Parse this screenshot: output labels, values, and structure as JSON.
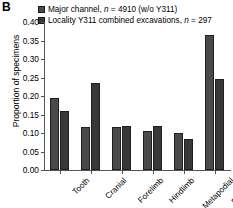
{
  "panel": {
    "label": "B"
  },
  "legend": {
    "items": [
      {
        "icon": "legend-swatch-square",
        "label_pre": "Major channel, ",
        "label_ital": "n",
        "label_post": " = 4910 (w/o Y311)",
        "color": "#4a4a4a"
      },
      {
        "icon": "legend-swatch-square",
        "label_pre": "Locality Y311 combined excavations, ",
        "label_ital": "n",
        "label_post": " = 297",
        "color": "#383838"
      }
    ]
  },
  "chart_data": {
    "type": "bar",
    "title": "",
    "xlabel": "",
    "ylabel": "Proportion of specimens",
    "ylim": [
      0.0,
      0.4
    ],
    "ytick_labels": [
      "0.00",
      "0.05",
      "0.10",
      "0.15",
      "0.20",
      "0.25",
      "0.30",
      "0.35",
      "0.40"
    ],
    "ytick_values": [
      0.0,
      0.05,
      0.1,
      0.15,
      0.2,
      0.25,
      0.3,
      0.35,
      0.4
    ],
    "grid": false,
    "legend_position": "top-left",
    "categories": [
      "Tooth",
      "Cranial",
      "Forelimb",
      "Hindlimb",
      "Metapodial",
      "Pod-Phal"
    ],
    "series": [
      {
        "name": "Major channel, n = 4910 (w/o Y311)",
        "color": "#4a4a4a",
        "values": [
          0.195,
          0.115,
          0.115,
          0.105,
          0.1,
          0.365
        ]
      },
      {
        "name": "Locality Y311 combined excavations, n = 297",
        "color": "#383838",
        "values": [
          0.16,
          0.235,
          0.12,
          0.12,
          0.085,
          0.245
        ]
      }
    ]
  }
}
